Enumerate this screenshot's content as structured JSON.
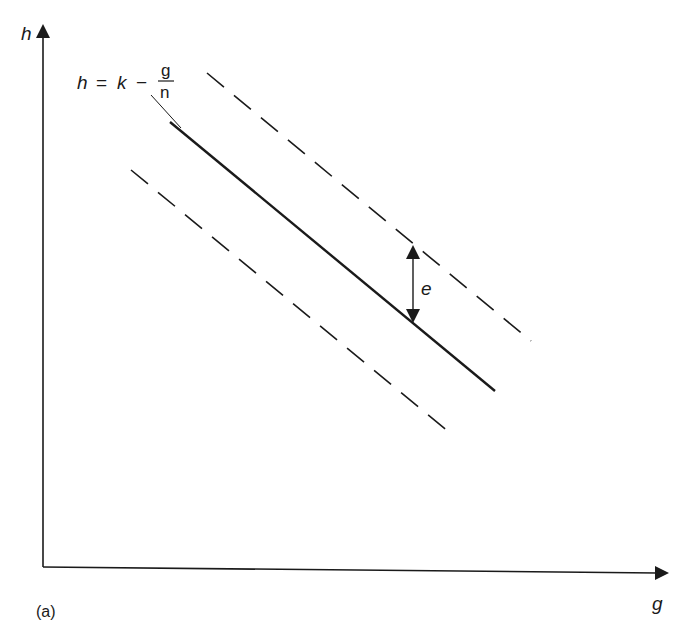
{
  "figure": {
    "panel_label": "(a)",
    "axes": {
      "y_label": "h",
      "x_label": "g"
    },
    "equation": {
      "lhs": "h",
      "eq": "=",
      "k": "k",
      "minus": "−",
      "numerator": "g",
      "denominator": "n"
    },
    "annotation": {
      "label": "e"
    },
    "lines": [
      {
        "name": "central-line",
        "style": "solid"
      },
      {
        "name": "upper-bound-line",
        "style": "dashed"
      },
      {
        "name": "lower-bound-line",
        "style": "dashed"
      }
    ],
    "colors": {
      "ink": "#1a1a1a",
      "background": "#ffffff"
    }
  }
}
